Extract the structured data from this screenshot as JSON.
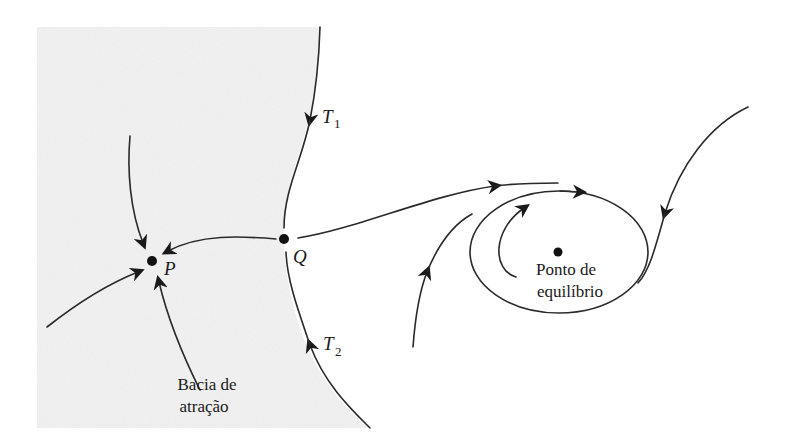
{
  "diagram": {
    "colors": {
      "basin_fill": "#ececec",
      "stroke": "#2a2a2a",
      "point": "#111111",
      "background": "#ffffff"
    },
    "points": {
      "P": {
        "label": "P",
        "x": 152,
        "y": 261
      },
      "Q": {
        "label": "Q",
        "x": 284,
        "y": 239
      },
      "equilibrium": {
        "x": 558,
        "y": 252
      }
    },
    "labels": {
      "T1_main": "T",
      "T1_sub": "1",
      "T2_main": "T",
      "T2_sub": "2",
      "P": "P",
      "Q": "Q",
      "basin_line1": "Bacia de",
      "basin_line2": "atração",
      "equilibrium_line1": "Ponto de",
      "equilibrium_line2": "equilíbrio"
    },
    "regions": {
      "basin_of_attraction": "shaded gray region left of separatrices T1 and T2"
    }
  }
}
